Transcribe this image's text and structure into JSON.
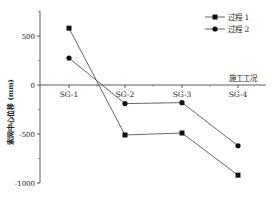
{
  "chart_data": {
    "type": "line",
    "title": "",
    "xlabel": "施工工况",
    "ylabel": "索网中心位移 (mm)",
    "categories": [
      "SG-1",
      "SG-2",
      "SG-3",
      "SG-4"
    ],
    "series": [
      {
        "name": "过程 1",
        "marker": "square",
        "values": [
          580,
          -510,
          -490,
          -920
        ]
      },
      {
        "name": "过程 2",
        "marker": "circle",
        "values": [
          275,
          -190,
          -180,
          -620
        ]
      }
    ],
    "ylim": [
      -1050,
      750
    ],
    "yticks": [
      500,
      0,
      -500,
      -1000
    ],
    "ytick_labels": [
      "500",
      "0",
      "-500",
      "-1000"
    ],
    "grid": false,
    "legend_position": "upper right"
  },
  "colors": {
    "line": "#555555",
    "marker": "#111111",
    "axis": "#333333"
  }
}
